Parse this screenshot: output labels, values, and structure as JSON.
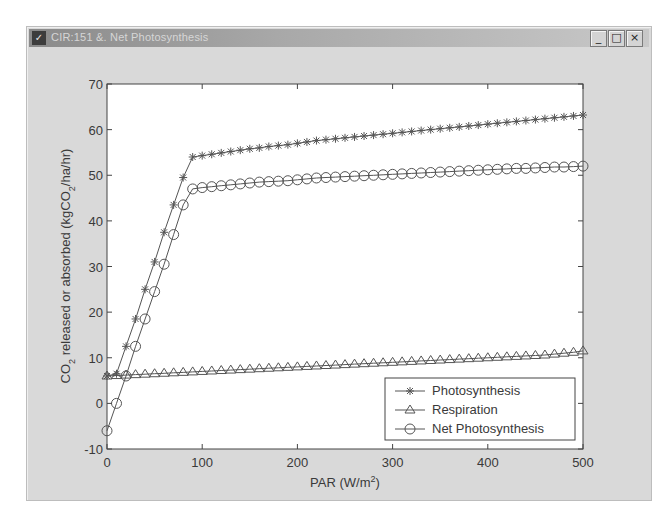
{
  "window": {
    "title": "CIR:151 &. Net Photosynthesis",
    "buttons": {
      "minimize": "_",
      "maximize": "□",
      "close": "×"
    }
  },
  "chart_data": {
    "type": "line",
    "title": "",
    "xlabel": "PAR (W/m²)",
    "ylabel": "CO₂ released or absorbed (kgCO₂/ha/hr)",
    "xlim": [
      0,
      500
    ],
    "ylim": [
      -10,
      70
    ],
    "xticks": [
      0,
      100,
      200,
      300,
      400,
      500
    ],
    "yticks": [
      -10,
      0,
      10,
      20,
      30,
      40,
      50,
      60,
      70
    ],
    "grid": false,
    "legend_position": "lower right",
    "series": [
      {
        "name": "Photosynthesis",
        "marker": "asterisk",
        "x": [
          0,
          10,
          20,
          30,
          40,
          50,
          60,
          70,
          80,
          90,
          100,
          110,
          120,
          130,
          140,
          150,
          160,
          170,
          180,
          190,
          200,
          210,
          220,
          230,
          240,
          250,
          260,
          270,
          280,
          290,
          300,
          310,
          320,
          330,
          340,
          350,
          360,
          370,
          380,
          390,
          400,
          410,
          420,
          430,
          440,
          450,
          460,
          470,
          480,
          490,
          500
        ],
        "values": [
          6.0,
          6.5,
          12.5,
          18.5,
          25.0,
          31.0,
          37.5,
          43.5,
          49.5,
          54.0,
          54.3,
          54.6,
          54.9,
          55.2,
          55.5,
          55.8,
          56.0,
          56.3,
          56.5,
          56.7,
          57.0,
          57.3,
          57.6,
          57.8,
          58.0,
          58.2,
          58.4,
          58.6,
          58.8,
          59.0,
          59.2,
          59.4,
          59.6,
          59.8,
          60.0,
          60.2,
          60.4,
          60.6,
          60.8,
          61.0,
          61.2,
          61.4,
          61.6,
          61.8,
          62.0,
          62.2,
          62.4,
          62.6,
          62.8,
          63.0,
          63.2
        ]
      },
      {
        "name": "Respiration",
        "marker": "triangle",
        "x": [
          0,
          10,
          20,
          30,
          40,
          50,
          60,
          70,
          80,
          90,
          100,
          110,
          120,
          130,
          140,
          150,
          160,
          170,
          180,
          190,
          200,
          210,
          220,
          230,
          240,
          250,
          260,
          270,
          280,
          290,
          300,
          310,
          320,
          330,
          340,
          350,
          360,
          370,
          380,
          390,
          400,
          410,
          420,
          430,
          440,
          450,
          460,
          470,
          480,
          490,
          500
        ],
        "values": [
          6.0,
          6.1,
          6.2,
          6.3,
          6.4,
          6.5,
          6.6,
          6.7,
          6.8,
          6.9,
          7.0,
          7.1,
          7.2,
          7.3,
          7.4,
          7.5,
          7.6,
          7.7,
          7.8,
          7.9,
          8.0,
          8.1,
          8.2,
          8.3,
          8.4,
          8.5,
          8.6,
          8.7,
          8.8,
          8.9,
          9.0,
          9.1,
          9.2,
          9.3,
          9.4,
          9.5,
          9.6,
          9.7,
          9.8,
          9.9,
          10.0,
          10.1,
          10.2,
          10.3,
          10.4,
          10.5,
          10.6,
          10.8,
          11.0,
          11.2,
          11.5
        ]
      },
      {
        "name": "Net Photosynthesis",
        "marker": "circle",
        "x": [
          0,
          10,
          20,
          30,
          40,
          50,
          60,
          70,
          80,
          90,
          100,
          110,
          120,
          130,
          140,
          150,
          160,
          170,
          180,
          190,
          200,
          210,
          220,
          230,
          240,
          250,
          260,
          270,
          280,
          290,
          300,
          310,
          320,
          330,
          340,
          350,
          360,
          370,
          380,
          390,
          400,
          410,
          420,
          430,
          440,
          450,
          460,
          470,
          480,
          490,
          500
        ],
        "values": [
          -6.0,
          0.0,
          6.0,
          12.5,
          18.5,
          24.5,
          30.5,
          37.0,
          43.5,
          47.0,
          47.3,
          47.5,
          47.7,
          47.9,
          48.1,
          48.3,
          48.5,
          48.6,
          48.7,
          48.8,
          49.0,
          49.2,
          49.4,
          49.5,
          49.6,
          49.7,
          49.8,
          49.9,
          50.0,
          50.1,
          50.2,
          50.3,
          50.4,
          50.5,
          50.6,
          50.7,
          50.8,
          50.9,
          51.0,
          51.1,
          51.2,
          51.3,
          51.4,
          51.5,
          51.5,
          51.6,
          51.7,
          51.8,
          51.8,
          51.9,
          52.0
        ]
      }
    ]
  },
  "labels": {
    "xlabel_main": "PAR (W/m",
    "xlabel_sup": "2",
    "xlabel_end": ")",
    "ylabel_a": "CO",
    "ylabel_sub": "2",
    "ylabel_b": " released or absorbed (kgCO",
    "ylabel_sub2": "2",
    "ylabel_c": "/ha/hr)"
  },
  "colors": {
    "window_bg": "#d9d9d9",
    "plot_bg": "#ffffff",
    "line": "#555555",
    "axis": "#444444",
    "text": "#3a3a3a"
  }
}
